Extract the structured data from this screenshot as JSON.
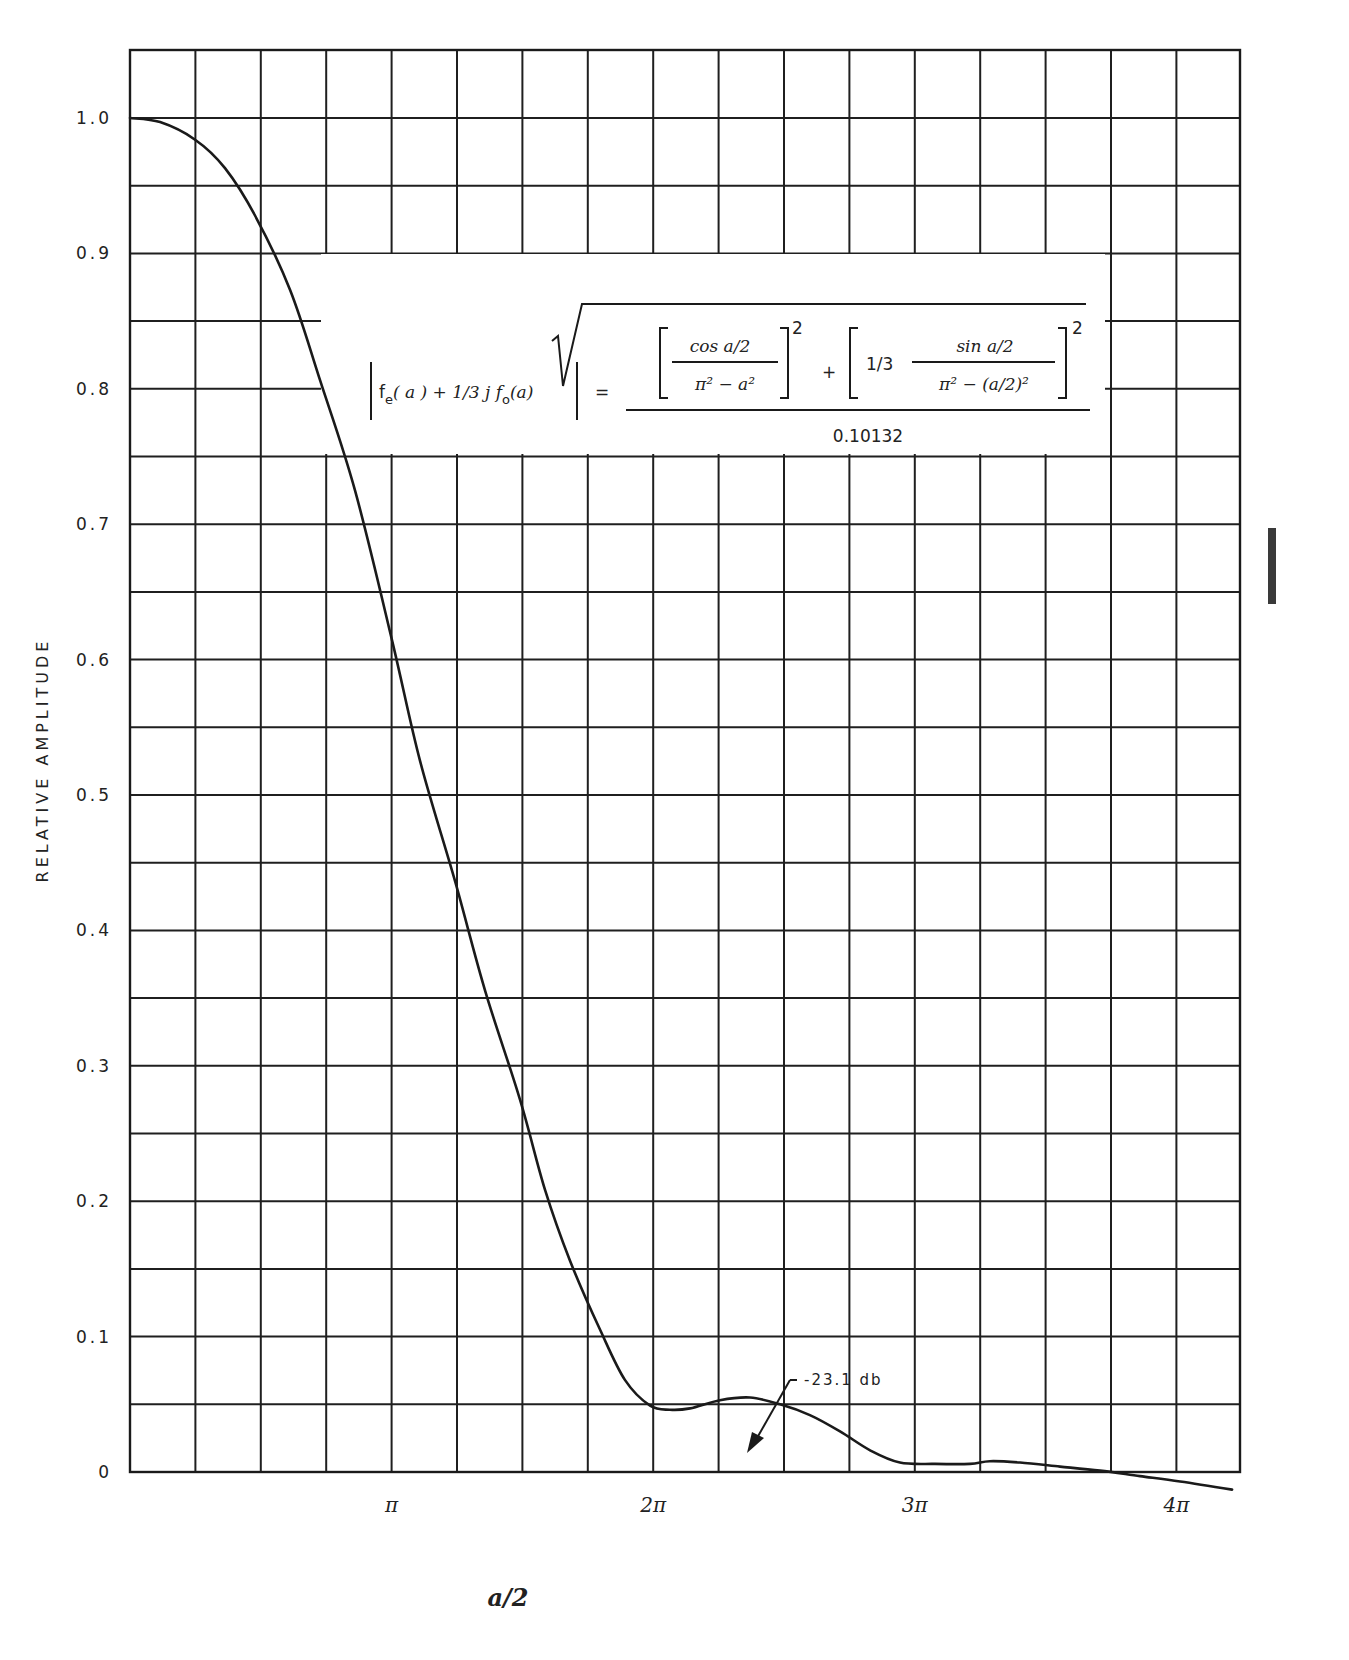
{
  "chart_data": {
    "type": "line",
    "title": "",
    "xlabel": "a/2",
    "ylabel": "RELATIVE AMPLITUDE",
    "xlim": [
      0,
      4.25
    ],
    "x_unit": "pi",
    "ylim": [
      0,
      1.05
    ],
    "grid": true,
    "x_ticks": [
      {
        "value": 1,
        "label": "π"
      },
      {
        "value": 2,
        "label": "2π"
      },
      {
        "value": 3,
        "label": "3π"
      },
      {
        "value": 4,
        "label": "4π"
      }
    ],
    "y_ticks": [
      {
        "value": 0,
        "label": "0"
      },
      {
        "value": 0.1,
        "label": "0.1"
      },
      {
        "value": 0.2,
        "label": "0.2"
      },
      {
        "value": 0.3,
        "label": "0.3"
      },
      {
        "value": 0.4,
        "label": "0.4"
      },
      {
        "value": 0.5,
        "label": "0.5"
      },
      {
        "value": 0.6,
        "label": "0.6"
      },
      {
        "value": 0.7,
        "label": "0.7"
      },
      {
        "value": 0.8,
        "label": "0.8"
      },
      {
        "value": 0.9,
        "label": "0.9"
      },
      {
        "value": 1.0,
        "label": "1.0"
      }
    ],
    "series": [
      {
        "name": "|fe(a) + 1/3 j fo(a)|",
        "x": [
          0,
          0.115,
          0.249,
          0.363,
          0.478,
          0.612,
          0.727,
          0.86,
          1.002,
          1.109,
          1.243,
          1.358,
          1.491,
          1.587,
          1.682,
          1.797,
          1.892,
          1.988,
          2.064,
          2.141,
          2.255,
          2.37,
          2.485,
          2.599,
          2.714,
          2.829,
          2.943,
          3.077,
          3.211,
          3.287,
          3.402,
          3.555,
          3.708,
          3.861,
          4.014,
          4.213
        ],
        "y": [
          1.0,
          0.997,
          0.984,
          0.963,
          0.928,
          0.873,
          0.806,
          0.725,
          0.614,
          0.525,
          0.436,
          0.355,
          0.275,
          0.208,
          0.156,
          0.105,
          0.068,
          0.049,
          0.046,
          0.047,
          0.053,
          0.055,
          0.05,
          0.042,
          0.03,
          0.016,
          0.007,
          0.006,
          0.006,
          0.008,
          0.007,
          0.004,
          0.001,
          -0.003,
          -0.007,
          -0.013
        ]
      }
    ],
    "annotations": [
      {
        "text": "-23.1 db",
        "x": 2.3,
        "y": 0.075,
        "arrow": true
      }
    ],
    "equation": {
      "lhs": "|fe(a) + 1/3 j fo(a)| =",
      "numerator": "√( [cos a/2 / (π² − a²)]² + [1/3 · sin a/2 / (π² − (a/2)²)]² )",
      "denominator": "0.10132"
    }
  },
  "labels": {
    "ylabel": "RELATIVE AMPLITUDE",
    "xlabel": "a/2",
    "annotation": "-23.1 db",
    "denominator": "0.10132",
    "eq_fe": "f",
    "eq_sub_e": "e",
    "eq_lhs_a1": "( a ) + 1/3 j f",
    "eq_sub_o": "o",
    "eq_lhs_a2": "(a)",
    "eq_equals": "=",
    "eq_cos": "cos a/2",
    "eq_den1": "π² − a²",
    "eq_plus": "+",
    "eq_third": "1/3",
    "eq_sin": "sin a/2",
    "eq_den2": "π² − (a/2)²",
    "eq_sq": "2"
  },
  "colors": {
    "ink": "#1a1a1a",
    "paper": "#ffffff"
  }
}
